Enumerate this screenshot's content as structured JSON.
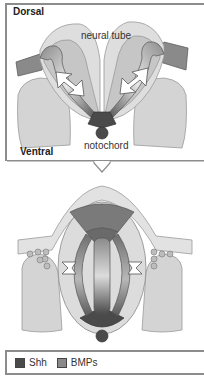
{
  "figure": {
    "top_panel": {
      "labels": {
        "dorsal": "Dorsal",
        "neural_tube": "neural tube",
        "notochord": "notochord",
        "ventral": "Ventral"
      }
    },
    "bottom_panel": {},
    "legend": [
      {
        "label": "Shh",
        "color": "#4a4a4a"
      },
      {
        "label": "BMPs",
        "color": "#8a8a8a"
      }
    ]
  },
  "colors": {
    "shh": "#4a4a4a",
    "bmp": "#8a8a8a",
    "tissue_light": "#d8d8d8",
    "tissue_mid": "#bdbdbd",
    "outline": "#7a7a7a",
    "frame": "#8c8c8c"
  }
}
